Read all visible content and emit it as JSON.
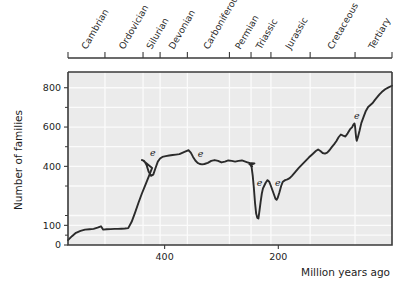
{
  "chart_data": {
    "type": "line",
    "title": "",
    "xlabel": "Million years ago",
    "ylabel": "Number of families",
    "xlim": [
      570,
      0
    ],
    "ylim": [
      0,
      880
    ],
    "x_ticks": [
      400,
      200
    ],
    "x_tick_labels": [
      "400",
      "200"
    ],
    "y_ticks": [
      0,
      100,
      400,
      600,
      800
    ],
    "y_tick_labels": [
      "0",
      "100",
      "400",
      "600",
      "800"
    ],
    "y_minor_ticks": [
      50,
      150,
      300,
      500,
      700
    ],
    "grid": true,
    "axis_direction": "x-reversed",
    "series": [
      {
        "name": "Marine family diversity",
        "points": [
          [
            570,
            25
          ],
          [
            563,
            45
          ],
          [
            556,
            62
          ],
          [
            548,
            72
          ],
          [
            540,
            78
          ],
          [
            532,
            80
          ],
          [
            525,
            82
          ],
          [
            518,
            88
          ],
          [
            512,
            95
          ],
          [
            508,
            78
          ],
          [
            502,
            80
          ],
          [
            495,
            81
          ],
          [
            488,
            82
          ],
          [
            482,
            82
          ],
          [
            476,
            83
          ],
          [
            470,
            84
          ],
          [
            464,
            86
          ],
          [
            458,
            118
          ],
          [
            452,
            165
          ],
          [
            446,
            215
          ],
          [
            440,
            262
          ],
          [
            434,
            305
          ],
          [
            428,
            348
          ],
          [
            422,
            392
          ],
          [
            438,
            430
          ],
          [
            440,
            432
          ],
          [
            436,
            428
          ],
          [
            432,
            408
          ],
          [
            428,
            372
          ],
          [
            424,
            352
          ],
          [
            420,
            358
          ],
          [
            416,
            392
          ],
          [
            412,
            424
          ],
          [
            408,
            440
          ],
          [
            404,
            448
          ],
          [
            398,
            452
          ],
          [
            392,
            455
          ],
          [
            386,
            458
          ],
          [
            380,
            460
          ],
          [
            374,
            462
          ],
          [
            368,
            470
          ],
          [
            362,
            478
          ],
          [
            358,
            482
          ],
          [
            354,
            470
          ],
          [
            350,
            448
          ],
          [
            346,
            430
          ],
          [
            342,
            418
          ],
          [
            338,
            412
          ],
          [
            334,
            410
          ],
          [
            330,
            412
          ],
          [
            324,
            418
          ],
          [
            318,
            428
          ],
          [
            312,
            432
          ],
          [
            306,
            428
          ],
          [
            300,
            420
          ],
          [
            294,
            424
          ],
          [
            288,
            430
          ],
          [
            282,
            428
          ],
          [
            276,
            424
          ],
          [
            270,
            428
          ],
          [
            264,
            430
          ],
          [
            258,
            424
          ],
          [
            252,
            418
          ],
          [
            248,
            414
          ],
          [
            245,
            412
          ],
          [
            242,
            415
          ],
          [
            252,
            418
          ],
          [
            250,
            416
          ],
          [
            248,
            410
          ],
          [
            246,
            400
          ],
          [
            251,
            412
          ],
          [
            249,
            408
          ],
          [
            247,
            396
          ],
          [
            245,
            352
          ],
          [
            243,
            290
          ],
          [
            241,
            215
          ],
          [
            239,
            160
          ],
          [
            237,
            138
          ],
          [
            235,
            135
          ],
          [
            233,
            178
          ],
          [
            231,
            222
          ],
          [
            229,
            262
          ],
          [
            227,
            288
          ],
          [
            225,
            300
          ],
          [
            222,
            318
          ],
          [
            219,
            330
          ],
          [
            216,
            322
          ],
          [
            213,
            300
          ],
          [
            210,
            276
          ],
          [
            207,
            252
          ],
          [
            205,
            235
          ],
          [
            203,
            230
          ],
          [
            201,
            240
          ],
          [
            198,
            268
          ],
          [
            195,
            300
          ],
          [
            192,
            322
          ],
          [
            188,
            330
          ],
          [
            184,
            334
          ],
          [
            180,
            340
          ],
          [
            176,
            352
          ],
          [
            170,
            372
          ],
          [
            164,
            392
          ],
          [
            158,
            410
          ],
          [
            152,
            428
          ],
          [
            146,
            446
          ],
          [
            140,
            462
          ],
          [
            134,
            478
          ],
          [
            130,
            486
          ],
          [
            126,
            478
          ],
          [
            122,
            468
          ],
          [
            118,
            465
          ],
          [
            114,
            470
          ],
          [
            110,
            482
          ],
          [
            106,
            498
          ],
          [
            102,
            512
          ],
          [
            98,
            528
          ],
          [
            94,
            548
          ],
          [
            90,
            562
          ],
          [
            86,
            556
          ],
          [
            82,
            552
          ],
          [
            78,
            568
          ],
          [
            74,
            588
          ],
          [
            70,
            600
          ],
          [
            68,
            612
          ],
          [
            66,
            618
          ],
          [
            65,
            604
          ],
          [
            64,
            572
          ],
          [
            63,
            545
          ],
          [
            62,
            530
          ],
          [
            60,
            548
          ],
          [
            57,
            582
          ],
          [
            54,
            620
          ],
          [
            50,
            652
          ],
          [
            46,
            682
          ],
          [
            42,
            702
          ],
          [
            38,
            712
          ],
          [
            34,
            722
          ],
          [
            30,
            738
          ],
          [
            26,
            752
          ],
          [
            22,
            766
          ],
          [
            18,
            778
          ],
          [
            12,
            792
          ],
          [
            6,
            802
          ],
          [
            0,
            810
          ]
        ]
      }
    ],
    "annotations": [
      {
        "label": "e",
        "x": 421,
        "y": 455,
        "name": "end-ordovician-extinction"
      },
      {
        "label": "e",
        "x": 337,
        "y": 450,
        "name": "late-devonian-extinction"
      },
      {
        "label": "e",
        "x": 233,
        "y": 300,
        "name": "end-permian-extinction"
      },
      {
        "label": "e",
        "x": 201,
        "y": 300,
        "name": "end-triassic-extinction"
      },
      {
        "label": "e",
        "x": 62,
        "y": 640,
        "name": "end-cretaceous-extinction"
      }
    ],
    "period_axis": {
      "name": "geologic-periods",
      "periods": [
        {
          "label": "Cambrian",
          "start": 570,
          "end": 505
        },
        {
          "label": "Ordovician",
          "start": 505,
          "end": 438
        },
        {
          "label": "Silurian",
          "start": 438,
          "end": 408
        },
        {
          "label": "Devonian",
          "start": 408,
          "end": 360
        },
        {
          "label": "Carboniferous",
          "start": 360,
          "end": 286
        },
        {
          "label": "Permian",
          "start": 286,
          "end": 248
        },
        {
          "label": "Triassic",
          "start": 248,
          "end": 213
        },
        {
          "label": "Jurassic",
          "start": 213,
          "end": 144
        },
        {
          "label": "Cretaceous",
          "start": 144,
          "end": 65
        },
        {
          "label": "Tertiary",
          "start": 65,
          "end": 0
        }
      ]
    }
  }
}
